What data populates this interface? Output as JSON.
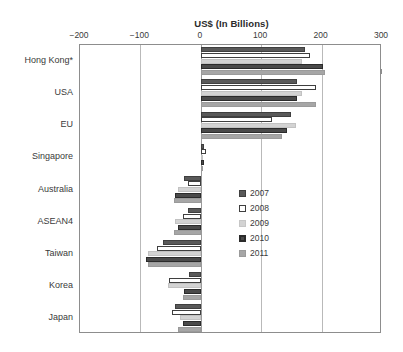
{
  "chart_data": {
    "type": "bar",
    "orientation": "horizontal",
    "title": "US$ (In Billions)",
    "xlabel": "US$ (In Billions)",
    "ylabel": "",
    "xlim": [
      -200,
      300
    ],
    "xticks": [
      -200,
      -100,
      0,
      100,
      200,
      300
    ],
    "xtick_labels": [
      "−200",
      "−100",
      "0",
      "100",
      "200",
      "300"
    ],
    "grid": true,
    "legend_position": "center-right",
    "categories": [
      "Hong Kong*",
      "USA",
      "EU",
      "Singapore",
      "Australia",
      "ASEAN4",
      "Taiwan",
      "Korea",
      "Japan"
    ],
    "series": [
      {
        "name": "2007",
        "color": "#595959",
        "values": [
          172,
          160,
          150,
          5,
          -28,
          -22,
          -62,
          -20,
          -42
        ]
      },
      {
        "name": "2008",
        "color": "#ffffff",
        "values": [
          180,
          190,
          118,
          8,
          -22,
          -30,
          -72,
          -52,
          -48
        ]
      },
      {
        "name": "2009",
        "color": "#d3d3d3",
        "values": [
          167,
          168,
          158,
          3,
          -38,
          -42,
          -88,
          -55,
          -35
        ]
      },
      {
        "name": "2010",
        "color": "#4a4a4a",
        "values": [
          202,
          160,
          142,
          6,
          -42,
          -38,
          -90,
          -28,
          -30
        ]
      },
      {
        "name": "2011",
        "color": "#a6a6a6",
        "values": [
          205,
          190,
          135,
          4,
          -44,
          -45,
          -88,
          -30,
          -38
        ]
      }
    ]
  },
  "legend": {
    "items": [
      {
        "label": "2007",
        "series": "s2007"
      },
      {
        "label": "2008",
        "series": "s2008"
      },
      {
        "label": "2009",
        "series": "s2009"
      },
      {
        "label": "2010",
        "series": "s2010"
      },
      {
        "label": "2011",
        "series": "s2011"
      }
    ]
  }
}
